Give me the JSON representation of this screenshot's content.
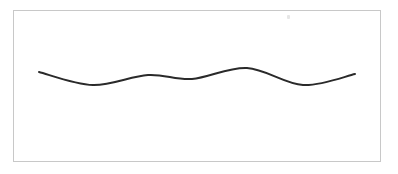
{
  "canvas": {
    "width": 398,
    "height": 174,
    "background": "#ffffff",
    "frame_border_color": "#c8c8c8"
  },
  "wave": {
    "stroke_color": "#2a2a2a",
    "stroke_width": 2,
    "points": [
      [
        39,
        72
      ],
      [
        93,
        85
      ],
      [
        148,
        75
      ],
      [
        192,
        79
      ],
      [
        247,
        68
      ],
      [
        303,
        85
      ],
      [
        355,
        74
      ]
    ]
  }
}
